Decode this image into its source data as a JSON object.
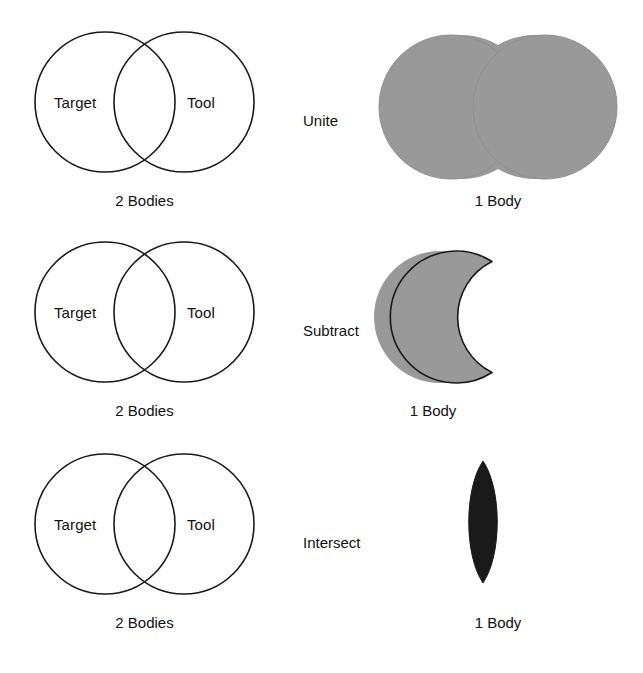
{
  "colors": {
    "outline": "#1a1a1a",
    "grey_fill": "#999999",
    "dark_fill": "#1a1a1a",
    "background": "#ffffff"
  },
  "labels": {
    "target": "Target",
    "tool": "Tool",
    "input_caption": "2 Bodies",
    "output_caption": "1 Body"
  },
  "rows": [
    {
      "operation": "Unite",
      "input_caption": "2 Bodies",
      "output_caption": "1 Body",
      "left_circle_label": "Target",
      "right_circle_label": "Tool",
      "result_shape": "union-of-two-circles",
      "result_fill": "#999999"
    },
    {
      "operation": "Subtract",
      "input_caption": "2 Bodies",
      "output_caption": "1 Body",
      "left_circle_label": "Target",
      "right_circle_label": "Tool",
      "result_shape": "crescent-target-minus-tool",
      "result_fill": "#999999"
    },
    {
      "operation": "Intersect",
      "input_caption": "2 Bodies",
      "output_caption": "1 Body",
      "left_circle_label": "Target",
      "right_circle_label": "Tool",
      "result_shape": "lens-intersection",
      "result_fill": "#1a1a1a"
    }
  ]
}
